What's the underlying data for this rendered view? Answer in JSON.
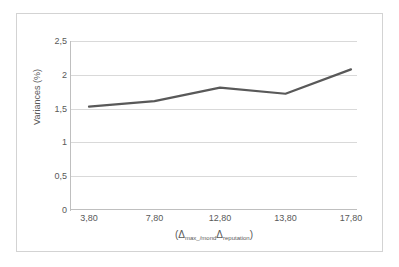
{
  "chart_data": {
    "type": "line",
    "title": "",
    "xlabel": "(Δmax_/mondΔreputation)",
    "ylabel": "Variances (%)",
    "categories": [
      "3,80",
      "7,80",
      "12,80",
      "13,80",
      "17,80"
    ],
    "values": [
      1.53,
      1.61,
      1.81,
      1.72,
      2.08
    ],
    "series": [
      {
        "name": "Variances",
        "values": [
          1.53,
          1.61,
          1.81,
          1.72,
          2.08
        ],
        "color": "#595959"
      }
    ],
    "ylim": [
      0,
      2.5
    ],
    "y_ticks": [
      "0",
      "0,5",
      "1",
      "1,5",
      "2",
      "2,5"
    ],
    "y_tick_values": [
      0,
      0.5,
      1,
      1.5,
      2,
      2.5
    ],
    "grid": true,
    "legend": "none"
  },
  "axes": {
    "y_title": "Variances (%)",
    "x_title_prefix": "(",
    "x_title_delta1": "Δ",
    "x_title_sub1": "max_/mond",
    "x_title_delta2": "Δ",
    "x_title_sub2": "reputation",
    "x_title_suffix": ")"
  },
  "colors": {
    "series": "#595959",
    "gridline": "#d9d9d9",
    "axis": "#bfbfbf",
    "border": "#d3d3d3",
    "text": "#595959",
    "background": "#ffffff"
  }
}
